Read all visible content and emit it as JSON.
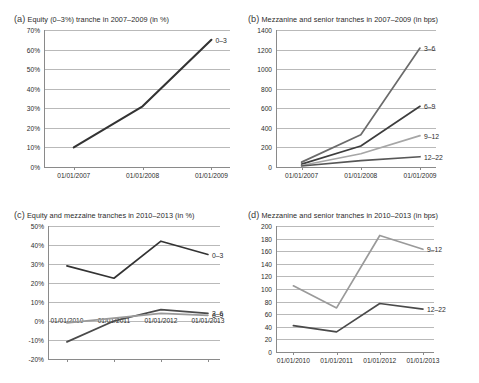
{
  "figure": {
    "name": "four-panel-tranche-spread-figure"
  },
  "panels": [
    {
      "key": "a",
      "label": "(a)",
      "title": "Equity (0–3%) tranche in 2007–2009 (in %)",
      "chart_data": {
        "type": "line",
        "title": "Equity (0–3%) tranche in 2007–2009 (in %)",
        "xlabel": "",
        "ylabel": "",
        "unit": "%",
        "grid": true,
        "legend_position": "inline-right-end-labels",
        "x": [
          "01/01/2007",
          "01/01/2008",
          "01/01/2009"
        ],
        "ylim": [
          0,
          70
        ],
        "yticks": [
          "0%",
          "10%",
          "20%",
          "30%",
          "40%",
          "50%",
          "60%",
          "70%"
        ],
        "ytick_values": [
          0,
          10,
          20,
          30,
          40,
          50,
          60,
          70
        ],
        "series": [
          {
            "name": "0–3",
            "values": [
              10,
              31,
              65
            ],
            "color": "#333333"
          }
        ]
      }
    },
    {
      "key": "b",
      "label": "(b)",
      "title": "Mezzanine and senior tranches in 2007–2009 (in bps)",
      "chart_data": {
        "type": "line",
        "title": "Mezzanine and senior tranches in 2007–2009 (in bps)",
        "xlabel": "",
        "ylabel": "",
        "unit": "bps",
        "grid": true,
        "legend_position": "inline-right-end-labels",
        "x": [
          "01/01/2007",
          "01/01/2008",
          "01/01/2009"
        ],
        "ylim": [
          0,
          1400
        ],
        "yticks": [
          "0",
          "200",
          "400",
          "600",
          "800",
          "1000",
          "1200",
          "1400"
        ],
        "ytick_values": [
          0,
          200,
          400,
          600,
          800,
          1000,
          1200,
          1400
        ],
        "series": [
          {
            "name": "3–6",
            "values": [
              50,
              330,
              1215
            ],
            "color": "#6b6b6b"
          },
          {
            "name": "6–9",
            "values": [
              30,
              215,
              620
            ],
            "color": "#3d3d3d"
          },
          {
            "name": "9–12",
            "values": [
              15,
              135,
              320
            ],
            "color": "#a6a6a6"
          },
          {
            "name": "12–22",
            "values": [
              10,
              65,
              105
            ],
            "color": "#575757"
          }
        ]
      }
    },
    {
      "key": "c",
      "label": "(c)",
      "title": "Equity and mezzaine tranches in 2010–2013 (in %)",
      "chart_data": {
        "type": "line",
        "title": "Equity and mezzaine tranches in 2010–2013 (in %)",
        "xlabel": "",
        "ylabel": "",
        "unit": "%",
        "grid": true,
        "legend_position": "inline-right-end-labels",
        "x": [
          "01/01/2010",
          "01/01/2011",
          "01/01/2012",
          "01/01/2013"
        ],
        "ylim": [
          -20,
          50
        ],
        "yticks": [
          "-20%",
          "-10%",
          "0%",
          "10%",
          "20%",
          "30%",
          "40%",
          "50%"
        ],
        "ytick_values": [
          -20,
          -10,
          0,
          10,
          20,
          30,
          40,
          50
        ],
        "series": [
          {
            "name": "0–3",
            "values": [
              29,
              22.5,
              42,
              35
            ],
            "color": "#333333"
          },
          {
            "name": "3–6",
            "values": [
              -11,
              0,
              6,
              4
            ],
            "color": "#4a4a4a"
          },
          {
            "name": "6–9",
            "values": [
              -1,
              1.5,
              4,
              3
            ],
            "color": "#9a9a9a"
          }
        ]
      }
    },
    {
      "key": "d",
      "label": "(d)",
      "title": "Mezzanine and senior tranches in 2010–2013 (in bps)",
      "chart_data": {
        "type": "line",
        "title": "Mezzanine and senior tranches in 2010–2013 (in bps)",
        "xlabel": "",
        "ylabel": "",
        "unit": "bps",
        "grid": true,
        "legend_position": "inline-right-end-labels",
        "x": [
          "01/01/2010",
          "01/01/2011",
          "01/01/2012",
          "01/01/2013"
        ],
        "ylim": [
          0,
          200
        ],
        "yticks": [
          "0",
          "20",
          "40",
          "60",
          "80",
          "100",
          "120",
          "140",
          "160",
          "180",
          "200"
        ],
        "ytick_values": [
          0,
          20,
          40,
          60,
          80,
          100,
          120,
          140,
          160,
          180,
          200
        ],
        "series": [
          {
            "name": "9–12",
            "values": [
              105,
              70,
              185,
              163
            ],
            "color": "#9a9a9a"
          },
          {
            "name": "12–22",
            "values": [
              42,
              32,
              77,
              68
            ],
            "color": "#4a4a4a"
          }
        ]
      }
    }
  ]
}
